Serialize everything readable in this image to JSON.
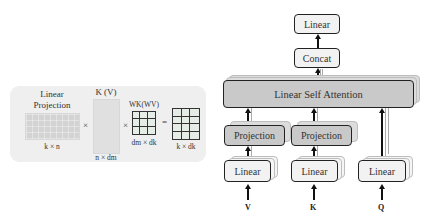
{
  "left_panel": {
    "linear_projection_title_line1": "Linear",
    "linear_projection_title_line2": "Projection",
    "linear_projection_dims": "k × n",
    "kv_title": "K (V)",
    "kv_dims": "n × d_m",
    "kv_dims_display": "n × dm",
    "w_title": "WK(WV)",
    "w_dims": "dm × dk",
    "result_dims": "k × dk",
    "times_symbol": "×",
    "equals_symbol": "="
  },
  "right_diagram": {
    "output_linear": "Linear",
    "concat": "Concat",
    "attention": "Linear Self Attention",
    "projection_v": "Projection",
    "projection_k": "Projection",
    "linear_v": "Linear",
    "linear_k": "Linear",
    "linear_q": "Linear",
    "input_v": "V",
    "input_k": "K",
    "input_q": "Q"
  },
  "colors": {
    "panel_bg": "#efefef",
    "dark_box": "#c9c9c9",
    "light_box": "#f2f2f2",
    "stroke": "#222222"
  }
}
